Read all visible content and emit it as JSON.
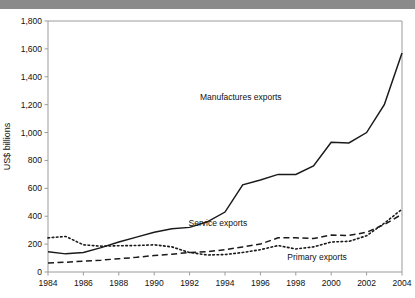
{
  "top_band": {
    "clipped_text": ""
  },
  "chart_data": {
    "type": "line",
    "title": "",
    "xlabel": "",
    "ylabel": "US$ billions",
    "xlim": [
      1984,
      2004
    ],
    "ylim": [
      0,
      1800
    ],
    "ytick_step": 200,
    "xtick_step": 2,
    "grid": false,
    "legend_position": "inline-annotations",
    "ytick_labels": [
      "0",
      "200",
      "400",
      "600",
      "800",
      "1,000",
      "1,200",
      "1,400",
      "1,600",
      "1,800"
    ],
    "ytick_values": [
      0,
      200,
      400,
      600,
      800,
      1000,
      1200,
      1400,
      1600,
      1800
    ],
    "xtick_labels": [
      "1984",
      "1986",
      "1988",
      "1990",
      "1992",
      "1994",
      "1996",
      "1998",
      "2000",
      "2002",
      "2004"
    ],
    "xtick_values": [
      1984,
      1986,
      1988,
      1990,
      1992,
      1994,
      1996,
      1998,
      2000,
      2002,
      2004
    ],
    "x": [
      1984,
      1985,
      1986,
      1987,
      1988,
      1989,
      1990,
      1991,
      1992,
      1993,
      1994,
      1995,
      1996,
      1997,
      1998,
      1999,
      2000,
      2001,
      2002,
      2003,
      2004
    ],
    "series": [
      {
        "name": "Manufactures exports",
        "style": "solid",
        "label_x": 1997.2,
        "label_y": 1235,
        "values": [
          145,
          130,
          140,
          175,
          215,
          250,
          285,
          310,
          320,
          360,
          430,
          625,
          660,
          700,
          700,
          760,
          930,
          925,
          1000,
          1200,
          1570
        ]
      },
      {
        "name": "Service exports",
        "style": "dashed",
        "label_x": 1993.6,
        "label_y": 330,
        "values": [
          65,
          70,
          78,
          85,
          95,
          105,
          118,
          128,
          140,
          145,
          160,
          180,
          200,
          245,
          245,
          240,
          265,
          262,
          285,
          340,
          415
        ]
      },
      {
        "name": "Primary exports",
        "style": "dotted",
        "label_x": 1999.2,
        "label_y": 85,
        "values": [
          245,
          255,
          195,
          185,
          188,
          190,
          195,
          180,
          140,
          122,
          125,
          140,
          160,
          190,
          165,
          180,
          215,
          220,
          260,
          350,
          450
        ]
      }
    ]
  }
}
